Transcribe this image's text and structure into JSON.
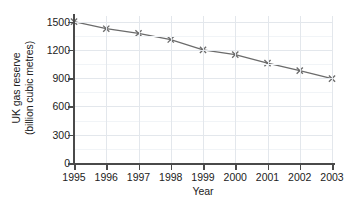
{
  "chart_data": {
    "type": "line",
    "title": "",
    "xlabel": "Year",
    "ylabel_lines": [
      "UK gas reserve",
      "(billion cubic metres)"
    ],
    "ylabel": "UK gas reserve (billion cubic metres)",
    "categories": [
      "1995",
      "1996",
      "1997",
      "1998",
      "1999",
      "2000",
      "2001",
      "2002",
      "2003"
    ],
    "x": [
      1995,
      1996,
      1997,
      1998,
      1999,
      2000,
      2001,
      2002,
      2003
    ],
    "values": [
      1500,
      1425,
      1375,
      1310,
      1200,
      1150,
      1060,
      980,
      895
    ],
    "series": [
      {
        "name": "UK gas reserve",
        "values": [
          1500,
          1425,
          1375,
          1310,
          1200,
          1150,
          1060,
          980,
          895
        ]
      }
    ],
    "ylim": [
      0,
      1560
    ],
    "yticks": [
      0,
      300,
      600,
      900,
      1200,
      1500
    ],
    "ytick_labels": [
      "0",
      "300",
      "600",
      "900",
      "1200",
      "1500"
    ],
    "xlim": [
      1995,
      2003
    ],
    "grid": true,
    "grid_axis": "both",
    "legend": "none",
    "marker": "x",
    "line_color": "#6b6b6b",
    "marker_color": "#6b6b6b",
    "grid_color": "#e3e7ec",
    "axis_color": "#4a4a4a",
    "background_color": "#ffffff"
  }
}
